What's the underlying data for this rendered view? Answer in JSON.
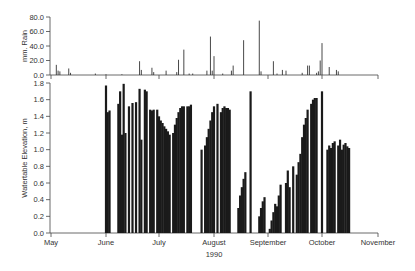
{
  "chart_data": [
    {
      "type": "bar",
      "panel": "top",
      "title": "",
      "xlabel": "",
      "ylabel": "mm. Rain",
      "ylim": [
        0,
        80
      ],
      "yticks": [
        "0.0",
        "20.0",
        "40.0",
        "60.0",
        "80.0"
      ],
      "x_unit": "day of year 1990",
      "xlim": [
        "May 1",
        "Nov 1"
      ],
      "grid": false,
      "series": [
        {
          "name": "Rainfall",
          "points": [
            {
              "x": 3,
              "y": 14
            },
            {
              "x": 4,
              "y": 6
            },
            {
              "x": 5,
              "y": 5
            },
            {
              "x": 10,
              "y": 9
            },
            {
              "x": 11,
              "y": 3
            },
            {
              "x": 25,
              "y": 2
            },
            {
              "x": 31,
              "y": 1
            },
            {
              "x": 40,
              "y": 1
            },
            {
              "x": 50,
              "y": 19
            },
            {
              "x": 51,
              "y": 7
            },
            {
              "x": 57,
              "y": 10
            },
            {
              "x": 58,
              "y": 4
            },
            {
              "x": 65,
              "y": 6
            },
            {
              "x": 71,
              "y": 4
            },
            {
              "x": 72,
              "y": 21
            },
            {
              "x": 75,
              "y": 35
            },
            {
              "x": 78,
              "y": 2
            },
            {
              "x": 80,
              "y": 2
            },
            {
              "x": 88,
              "y": 6
            },
            {
              "x": 90,
              "y": 53
            },
            {
              "x": 91,
              "y": 6
            },
            {
              "x": 92,
              "y": 26
            },
            {
              "x": 97,
              "y": 2
            },
            {
              "x": 102,
              "y": 6
            },
            {
              "x": 103,
              "y": 13
            },
            {
              "x": 109,
              "y": 48
            },
            {
              "x": 118,
              "y": 75
            },
            {
              "x": 119,
              "y": 5
            },
            {
              "x": 126,
              "y": 19
            },
            {
              "x": 128,
              "y": 2
            },
            {
              "x": 131,
              "y": 7
            },
            {
              "x": 133,
              "y": 6
            },
            {
              "x": 142,
              "y": 3
            },
            {
              "x": 145,
              "y": 13
            },
            {
              "x": 146,
              "y": 13
            },
            {
              "x": 150,
              "y": 3
            },
            {
              "x": 151,
              "y": 5
            },
            {
              "x": 152,
              "y": 20
            },
            {
              "x": 153,
              "y": 44
            },
            {
              "x": 157,
              "y": 11
            },
            {
              "x": 161,
              "y": 7
            },
            {
              "x": 162,
              "y": 5
            }
          ]
        }
      ]
    },
    {
      "type": "area",
      "panel": "bottom",
      "title": "",
      "xlabel": "1990",
      "ylabel": "Watertable Elevation, m",
      "ylim": [
        0,
        1.8
      ],
      "yticks": [
        "0.0",
        "0.2",
        "0.4",
        "0.6",
        "0.8",
        "1.0",
        "1.2",
        "1.4",
        "1.6",
        "1.8"
      ],
      "categories": [
        "May",
        "June",
        "July",
        "August",
        "September",
        "October",
        "November"
      ],
      "grid": false,
      "series": [
        {
          "name": "Watertable Elevation",
          "points": [
            [
              31,
              1.77
            ],
            [
              32,
              1.45
            ],
            [
              33,
              1.47
            ],
            [
              38,
              1.55
            ],
            [
              39,
              1.7
            ],
            [
              40,
              1.18
            ],
            [
              41,
              1.79
            ],
            [
              42,
              1.2
            ],
            [
              44,
              1.52
            ],
            [
              46,
              1.56
            ],
            [
              48,
              1.57
            ],
            [
              50,
              1.73
            ],
            [
              51,
              1.12
            ],
            [
              53,
              1.72
            ],
            [
              54,
              1.7
            ],
            [
              56,
              1.48
            ],
            [
              57,
              1.47
            ],
            [
              58,
              1.48
            ],
            [
              60,
              1.48
            ],
            [
              61,
              1.4
            ],
            [
              62,
              1.35
            ],
            [
              63,
              1.32
            ],
            [
              64,
              1.28
            ],
            [
              65,
              1.25
            ],
            [
              66,
              1.22
            ],
            [
              67,
              1.18
            ],
            [
              69,
              1.2
            ],
            [
              70,
              1.3
            ],
            [
              71,
              1.38
            ],
            [
              72,
              1.45
            ],
            [
              73,
              1.5
            ],
            [
              74,
              1.52
            ],
            [
              75,
              1.52
            ],
            [
              77,
              1.52
            ],
            [
              78,
              1.52
            ],
            [
              79,
              1.54
            ],
            [
              85,
              1.0
            ],
            [
              87,
              1.05
            ],
            [
              88,
              1.15
            ],
            [
              89,
              1.25
            ],
            [
              90,
              1.35
            ],
            [
              91,
              1.45
            ],
            [
              92,
              1.52
            ],
            [
              94,
              1.55
            ],
            [
              96,
              1.45
            ],
            [
              97,
              1.5
            ],
            [
              98,
              1.52
            ],
            [
              99,
              1.5
            ],
            [
              100,
              1.5
            ],
            [
              101,
              1.48
            ],
            [
              106,
              0.3
            ],
            [
              107,
              0.45
            ],
            [
              108,
              0.55
            ],
            [
              109,
              0.65
            ],
            [
              110,
              0.73
            ],
            [
              113,
              1.7
            ],
            [
              118,
              0.2
            ],
            [
              119,
              0.3
            ],
            [
              120,
              0.38
            ],
            [
              121,
              0.43
            ],
            [
              124,
              0.05
            ],
            [
              125,
              0.15
            ],
            [
              126,
              0.25
            ],
            [
              127,
              0.35
            ],
            [
              128,
              0.32
            ],
            [
              129,
              0.45
            ],
            [
              130,
              0.58
            ],
            [
              133,
              0.6
            ],
            [
              134,
              0.75
            ],
            [
              135,
              0.55
            ],
            [
              137,
              0.8
            ],
            [
              139,
              0.7
            ],
            [
              140,
              0.85
            ],
            [
              141,
              0.95
            ],
            [
              142,
              1.15
            ],
            [
              143,
              1.3
            ],
            [
              144,
              1.38
            ],
            [
              145,
              1.48
            ],
            [
              147,
              1.55
            ],
            [
              148,
              1.6
            ],
            [
              149,
              1.62
            ],
            [
              150,
              1.62
            ],
            [
              153,
              1.7
            ],
            [
              156,
              1.0
            ],
            [
              157,
              1.05
            ],
            [
              158,
              1.02
            ],
            [
              159,
              1.08
            ],
            [
              160,
              1.1
            ],
            [
              162,
              1.05
            ],
            [
              163,
              1.12
            ],
            [
              164,
              1.0
            ],
            [
              165,
              1.06
            ],
            [
              166,
              1.08
            ],
            [
              167,
              1.04
            ],
            [
              168,
              1.02
            ]
          ]
        }
      ]
    }
  ],
  "upper_panel": {
    "ylabel": "mm. Rain",
    "yticks": [
      "0.0",
      "20.0",
      "40.0",
      "60.0",
      "80.0"
    ]
  },
  "lower_panel": {
    "ylabel": "Watertable Elevation, m",
    "yticks": [
      "0.0",
      "0.2",
      "0.4",
      "0.6",
      "0.8",
      "1.0",
      "1.2",
      "1.4",
      "1.6",
      "1.8"
    ],
    "xticks": [
      "May",
      "June",
      "July",
      "August",
      "September",
      "October",
      "November"
    ],
    "xlabel": "1990"
  },
  "colors": {
    "bars": "#1a1a1a",
    "axis": "#444444",
    "text": "#333333"
  }
}
